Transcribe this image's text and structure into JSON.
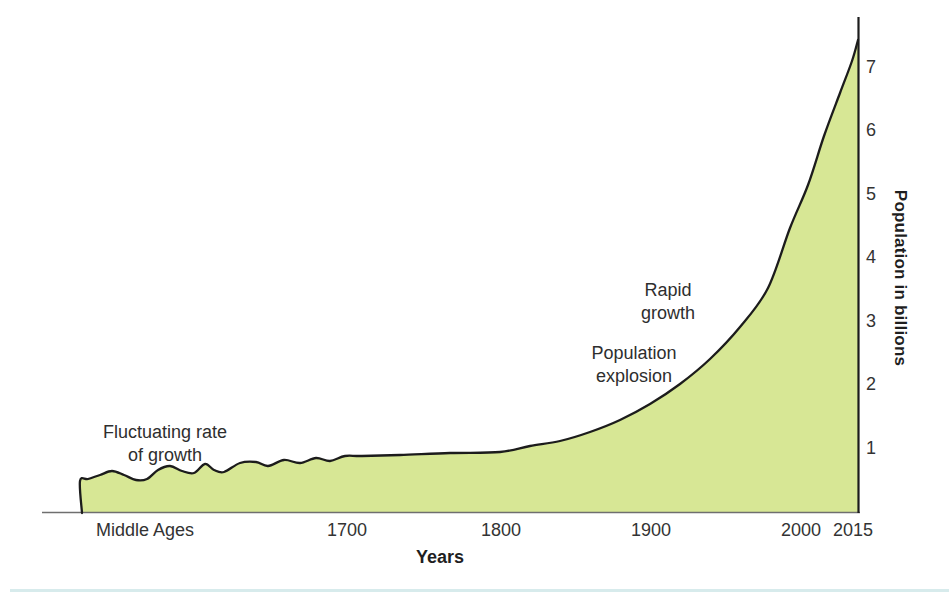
{
  "chart_data": {
    "type": "area",
    "title": "",
    "xlabel": "Years",
    "ylabel": "Population in billions",
    "x_ticks": [
      {
        "label": "Middle Ages",
        "px": 145
      },
      {
        "label": "1700",
        "px": 347
      },
      {
        "label": "1800",
        "px": 501
      },
      {
        "label": "1900",
        "px": 651
      },
      {
        "label": "2000",
        "px": 801
      },
      {
        "label": "2015",
        "px": 853
      }
    ],
    "y_ticks": [
      {
        "label": "1",
        "value": 1
      },
      {
        "label": "2",
        "value": 2
      },
      {
        "label": "3",
        "value": 3
      },
      {
        "label": "4",
        "value": 4
      },
      {
        "label": "5",
        "value": 5
      },
      {
        "label": "6",
        "value": 6
      },
      {
        "label": "7",
        "value": 7
      }
    ],
    "ylim": [
      0,
      7.6
    ],
    "grid": false,
    "legend": "none",
    "annotations": [
      {
        "name": "fluctuating-rate",
        "lines": [
          "Fluctuating rate",
          "of growth"
        ],
        "cx": 165,
        "top": 421
      },
      {
        "name": "rapid-growth",
        "lines": [
          "Rapid",
          "growth"
        ],
        "cx": 668,
        "top": 279
      },
      {
        "name": "population-explosion",
        "lines": [
          "Population",
          "explosion"
        ],
        "cx": 634,
        "top": 342
      }
    ],
    "series": [
      {
        "name": "World population",
        "estimated_points": [
          {
            "x": "Middle Ages",
            "y_billions": 0.5
          },
          {
            "x": "1700",
            "y_billions": 0.9
          },
          {
            "x": "1800",
            "y_billions": 0.95
          },
          {
            "x": "1900",
            "y_billions": 1.7
          },
          {
            "x": "1950",
            "y_billions": 2.5
          },
          {
            "x": "2000",
            "y_billions": 4.9
          },
          {
            "x": "2015",
            "y_billions": 7.4
          }
        ],
        "curve_px": [
          [
            82,
            513
          ],
          [
            80,
            481
          ],
          [
            88,
            479
          ],
          [
            100,
            475
          ],
          [
            112,
            471
          ],
          [
            124,
            475
          ],
          [
            136,
            480
          ],
          [
            147,
            479
          ],
          [
            158,
            470
          ],
          [
            170,
            466
          ],
          [
            182,
            471
          ],
          [
            194,
            473
          ],
          [
            205,
            464
          ],
          [
            214,
            470
          ],
          [
            224,
            472
          ],
          [
            240,
            463
          ],
          [
            256,
            462
          ],
          [
            268,
            466
          ],
          [
            284,
            460
          ],
          [
            300,
            463
          ],
          [
            316,
            458
          ],
          [
            330,
            461
          ],
          [
            345,
            456
          ],
          [
            362,
            456
          ],
          [
            400,
            455
          ],
          [
            450,
            453
          ],
          [
            500,
            452
          ],
          [
            530,
            446
          ],
          [
            560,
            441
          ],
          [
            590,
            432
          ],
          [
            620,
            420
          ],
          [
            650,
            404
          ],
          [
            680,
            384
          ],
          [
            710,
            359
          ],
          [
            740,
            327
          ],
          [
            768,
            288
          ],
          [
            790,
            228
          ],
          [
            808,
            185
          ],
          [
            824,
            136
          ],
          [
            840,
            93
          ],
          [
            852,
            61
          ],
          [
            858,
            40
          ]
        ]
      }
    ],
    "axis_px": {
      "x_axis": {
        "x1": 42,
        "y1": 512.5,
        "x2": 860,
        "y2": 512.5
      },
      "y_axis": {
        "x1": 858.5,
        "y1": 17,
        "x2": 858.5,
        "y2": 513
      },
      "zero_px": 511,
      "px_per_billion": 63.5,
      "y_tick_label_x": 866,
      "x_tick_label_y": 519
    },
    "colors": {
      "area_fill": "#d7e795",
      "curve_stroke": "#1c1c1c",
      "x_axis": "#6f6f6f",
      "y_axis": "#1c1c1c",
      "text": "#303030",
      "bottom_rule": "#d7ebec"
    }
  }
}
